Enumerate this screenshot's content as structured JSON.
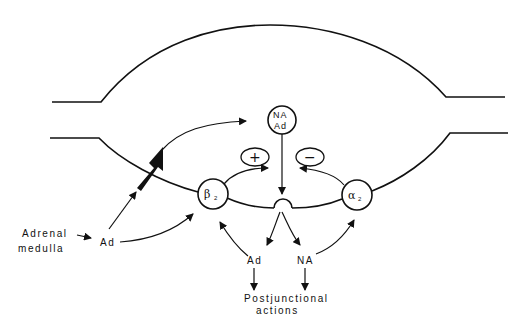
{
  "diagram": {
    "type": "synaptic varicosity schematic",
    "nodes": {
      "vesicle": {
        "line1": "NA",
        "line2": "Ad"
      },
      "beta_receptor": {
        "symbol": "β",
        "subscript": "2"
      },
      "alpha_receptor": {
        "symbol": "α",
        "subscript": "2"
      },
      "plus": {
        "symbol": "+"
      },
      "minus": {
        "symbol": "−"
      }
    },
    "labels": {
      "adrenal_line1": "Adrenal",
      "adrenal_line2": "medulla",
      "ad_circulating": "Ad",
      "ad_released": "Ad",
      "na_released": "NA",
      "postjunctional_line1": "Postjunctional",
      "postjunctional_line2": "actions"
    },
    "edges": [
      {
        "from": "Adrenal medulla",
        "to": "Ad (circulating)"
      },
      {
        "from": "Ad (circulating)",
        "to": "nerve terminal (uptake, bold arrow)"
      },
      {
        "from": "Ad (circulating)",
        "to": "β2"
      },
      {
        "from": "uptake",
        "to": "NA/Ad store"
      },
      {
        "from": "NA/Ad store",
        "to": "release site"
      },
      {
        "from": "release site",
        "to": "Ad"
      },
      {
        "from": "release site",
        "to": "NA"
      },
      {
        "from": "Ad",
        "to": "β2"
      },
      {
        "from": "NA",
        "to": "α2"
      },
      {
        "from": "β2",
        "to": "+ (facilitation)"
      },
      {
        "from": "α2",
        "to": "− (inhibition)"
      },
      {
        "from": "Ad",
        "to": "Postjunctional actions"
      },
      {
        "from": "NA",
        "to": "Postjunctional actions"
      }
    ]
  }
}
